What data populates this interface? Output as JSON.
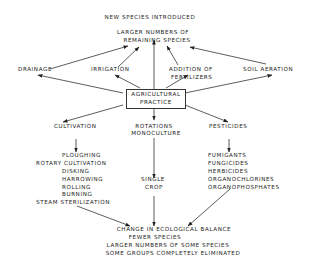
{
  "diagram": {
    "top_label": "NEW SPECIES INTRODUCED",
    "top_result": [
      "LARGER NUMBERS OF",
      "REMAINING SPECIES"
    ],
    "center": [
      "AGRICULTURAL",
      "PRACTICE"
    ],
    "upper_factors": {
      "drainage": "DRAINAGE",
      "irrigation": "IRRIGATION",
      "fertilizers": [
        "ADDITION OF",
        "FERTILIZERS"
      ],
      "soil_aeration": "SOIL AERATION"
    },
    "lower_branches": {
      "cultivation": {
        "label": "CULTIVATION",
        "items": [
          "PLOUGHING",
          "ROTARY CULTIVATION",
          "DISKING",
          "HARROWING",
          "ROLLING",
          "BURNING",
          "STEAM STERILIZATION"
        ]
      },
      "rotations": {
        "label": [
          "ROTATIONS",
          "MONOCULTURE"
        ],
        "items": [
          "SINGLE",
          "CROP"
        ]
      },
      "pesticides": {
        "label": "PESTICIDES",
        "items": [
          "FUMIGANTS",
          "FUNGICIDES",
          "HERBICIDES",
          "ORGANOCHLORINES",
          "ORGANOPHOSPHATES"
        ]
      }
    },
    "outcome": [
      "CHANGE IN ECOLOGICAL BALANCE",
      "FEWER SPECIES",
      "LARGER NUMBERS OF SOME SPECIES",
      "SOME GROUPS COMPLETELY ELIMINATED"
    ]
  }
}
